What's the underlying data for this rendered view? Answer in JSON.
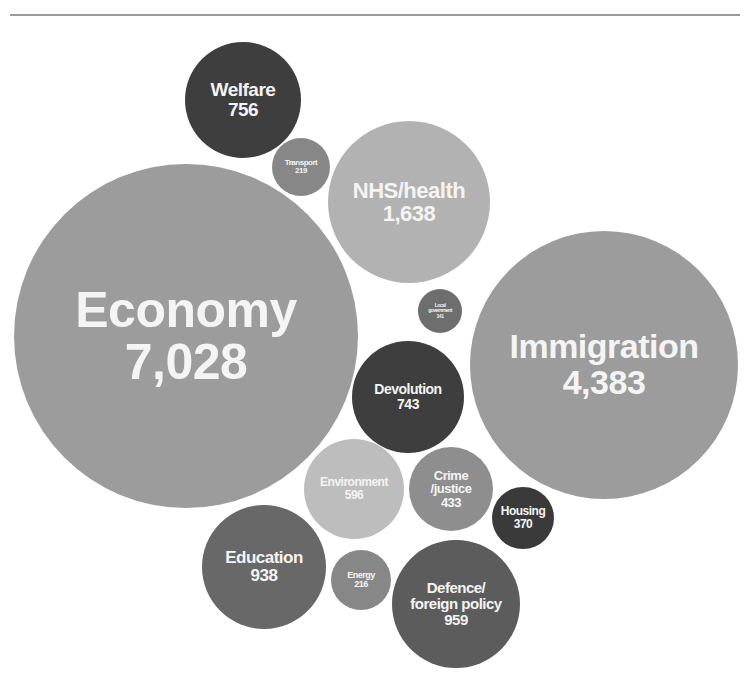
{
  "chart_data": {
    "type": "bubble",
    "title": "",
    "note": "Caption above top rule is cut off in the screenshot",
    "bubbles": [
      {
        "id": "economy",
        "label": "Economy",
        "value": 7028,
        "value_text": "7,028",
        "cx": 186,
        "cy": 336,
        "r": 172,
        "color": "#9c9c9c",
        "font_label": 50,
        "font_value": 50
      },
      {
        "id": "immigration",
        "label": "Immigration",
        "value": 4383,
        "value_text": "4,383",
        "cx": 604,
        "cy": 365,
        "r": 134,
        "color": "#9c9c9c",
        "font_label": 34,
        "font_value": 34
      },
      {
        "id": "nhs-health",
        "label": "NHS/health",
        "value": 1638,
        "value_text": "1,638",
        "cx": 409,
        "cy": 202,
        "r": 81,
        "color": "#b2b2b2",
        "font_label": 22,
        "font_value": 22
      },
      {
        "id": "defence-foreign-policy",
        "label": "Defence/\nforeign policy",
        "value": 959,
        "value_text": "959",
        "cx": 456,
        "cy": 604,
        "r": 64,
        "color": "#5c5c5c",
        "font_label": 15,
        "font_value": 15
      },
      {
        "id": "education",
        "label": "Education",
        "value": 938,
        "value_text": "938",
        "cx": 264,
        "cy": 567,
        "r": 62,
        "color": "#686868",
        "font_label": 17,
        "font_value": 17
      },
      {
        "id": "welfare",
        "label": "Welfare",
        "value": 756,
        "value_text": "756",
        "cx": 243,
        "cy": 100,
        "r": 58,
        "color": "#3e3e3e",
        "font_label": 19,
        "font_value": 19
      },
      {
        "id": "devolution",
        "label": "Devolution",
        "value": 743,
        "value_text": "743",
        "cx": 408,
        "cy": 397,
        "r": 56,
        "color": "#3e3e3e",
        "font_label": 14,
        "font_value": 14
      },
      {
        "id": "environment",
        "label": "Environment",
        "value": 596,
        "value_text": "596",
        "cx": 354,
        "cy": 489,
        "r": 50,
        "color": "#bdbdbd",
        "font_label": 12,
        "font_value": 12
      },
      {
        "id": "crime-justice",
        "label": "Crime\n/justice",
        "value": 433,
        "value_text": "433",
        "cx": 451,
        "cy": 489,
        "r": 42,
        "color": "#8e8e8e",
        "font_label": 13,
        "font_value": 13
      },
      {
        "id": "housing",
        "label": "Housing",
        "value": 370,
        "value_text": "370",
        "cx": 523,
        "cy": 518,
        "r": 31,
        "color": "#3a3a3a",
        "font_label": 12,
        "font_value": 12
      },
      {
        "id": "transport",
        "label": "Transport",
        "value": 219,
        "value_text": "219",
        "cx": 301,
        "cy": 167,
        "r": 29,
        "color": "#878787",
        "font_label": 8,
        "font_value": 8
      },
      {
        "id": "energy",
        "label": "Energy",
        "value": 216,
        "value_text": "216",
        "cx": 361,
        "cy": 580,
        "r": 30,
        "color": "#878787",
        "font_label": 9,
        "font_value": 9
      },
      {
        "id": "local-government",
        "label": "Local\ngovernment",
        "value": 141,
        "value_text": "141",
        "cx": 440,
        "cy": 311,
        "r": 22,
        "color": "#6e6e6e",
        "font_label": 5,
        "font_value": 5
      }
    ]
  }
}
